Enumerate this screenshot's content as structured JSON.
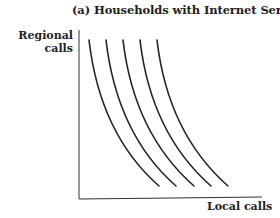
{
  "figure": {
    "title": "(a) Households with Internet Service",
    "y_axis_label_line1": "Regional",
    "y_axis_label_line2": "calls",
    "x_axis_label": "Local calls",
    "curve_count": 5,
    "curve_color": "#222222",
    "axis_color": "#333333"
  }
}
